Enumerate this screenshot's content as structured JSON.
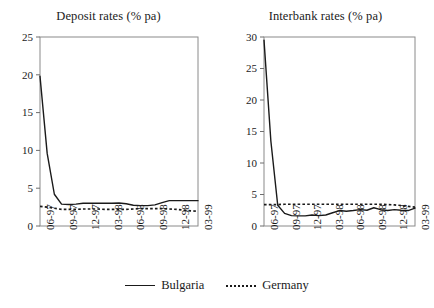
{
  "chart_data": [
    {
      "type": "line",
      "title": "Deposit rates (% pa)",
      "xlabel": "",
      "ylabel": "",
      "ylim": [
        0,
        25
      ],
      "yticks": [
        0,
        5,
        10,
        15,
        20,
        25
      ],
      "grid": false,
      "legend_position": "bottom",
      "categories": [
        "06-97",
        "09-97",
        "12-97",
        "03-98",
        "06-98",
        "09-98",
        "12-98",
        "03-99"
      ],
      "x": [
        0,
        1,
        2,
        3,
        4,
        5,
        6,
        7,
        8,
        9,
        10,
        11,
        12,
        13,
        14,
        15,
        16,
        17,
        18,
        19,
        20,
        21,
        22
      ],
      "series": [
        {
          "name": "Bulgaria",
          "style": "solid",
          "color": "#1a1a1a",
          "values": [
            19.8,
            9.6,
            4.2,
            2.9,
            2.85,
            2.9,
            3.0,
            3.0,
            3.0,
            3.0,
            3.0,
            3.05,
            2.95,
            2.75,
            2.7,
            2.7,
            2.8,
            3.1,
            3.35,
            3.35,
            3.35,
            3.35,
            3.35
          ]
        },
        {
          "name": "Germany",
          "style": "dotted",
          "color": "#1a1a1a",
          "values": [
            2.6,
            2.5,
            2.35,
            2.2,
            2.2,
            2.2,
            2.25,
            2.25,
            2.25,
            2.2,
            2.2,
            2.2,
            2.2,
            2.25,
            2.3,
            2.3,
            2.3,
            2.3,
            2.25,
            2.2,
            2.1,
            2.0,
            1.95
          ]
        }
      ]
    },
    {
      "type": "line",
      "title": "Interbank rates (% pa)",
      "xlabel": "",
      "ylabel": "",
      "ylim": [
        0,
        30
      ],
      "yticks": [
        0,
        5,
        10,
        15,
        20,
        25,
        30
      ],
      "grid": false,
      "legend_position": "bottom",
      "categories": [
        "06-97",
        "09-97",
        "12-97",
        "03-98",
        "06-98",
        "09-98",
        "12-98",
        "03-99"
      ],
      "x": [
        0,
        1,
        2,
        3,
        4,
        5,
        6,
        7,
        8,
        9,
        10,
        11,
        12,
        13,
        14,
        15,
        16,
        17,
        18,
        19,
        20,
        21,
        22
      ],
      "series": [
        {
          "name": "Bulgaria",
          "style": "solid",
          "color": "#1a1a1a",
          "values": [
            29.5,
            13.5,
            3.3,
            2.0,
            1.65,
            1.6,
            1.6,
            1.75,
            1.65,
            1.75,
            2.1,
            2.45,
            2.35,
            2.45,
            2.6,
            2.5,
            2.9,
            2.6,
            2.45,
            2.6,
            2.5,
            2.45,
            2.85
          ]
        },
        {
          "name": "Germany",
          "style": "dotted",
          "color": "#1a1a1a",
          "values": [
            3.4,
            3.4,
            3.4,
            3.45,
            3.45,
            3.45,
            3.45,
            3.45,
            3.45,
            3.45,
            3.45,
            3.45,
            3.45,
            3.45,
            3.45,
            3.45,
            3.45,
            3.45,
            3.4,
            3.35,
            3.25,
            3.1,
            3.0
          ]
        }
      ]
    }
  ],
  "panels": [
    {
      "title": "Deposit rates (% pa)",
      "ytick_labels": [
        "25",
        "20",
        "15",
        "10",
        "5",
        "0"
      ],
      "xtick_labels": [
        "06-97",
        "09-97",
        "12-97",
        "03-98",
        "06-98",
        "09-98",
        "12-98",
        "03-99"
      ]
    },
    {
      "title": "Interbank rates (% pa)",
      "ytick_labels": [
        "30",
        "25",
        "20",
        "15",
        "10",
        "5",
        "0"
      ],
      "xtick_labels": [
        "06-97",
        "09-97",
        "12-97",
        "03-98",
        "06-98",
        "09-98",
        "12-98",
        "03-99"
      ]
    }
  ],
  "legend": {
    "bulgaria_label": "Bulgaria",
    "germany_label": "Germany"
  },
  "colors": {
    "line": "#1a1a1a",
    "axis": "#6e6e6e",
    "background": "#ffffff"
  }
}
